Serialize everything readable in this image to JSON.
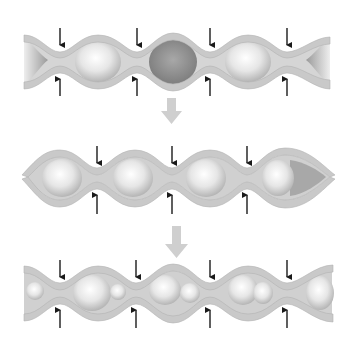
{
  "diagram": {
    "title": "",
    "colors": {
      "wall": "#c9c9c9",
      "wall_edge": "#b2b2b2",
      "lumen": "#8f8f8f",
      "lumen_light": "#d8d8d8",
      "bolus": "#f2f2f2",
      "bolus_shade": "#bdbdbd",
      "constriction_arrow": "#1a1a1a",
      "step_arrow": "#cfcfcf"
    },
    "stages": [
      {
        "id": "stage-1",
        "constriction_x": [
          60,
          137,
          210,
          287
        ],
        "bolus_count": 2,
        "empty_segment": "center"
      },
      {
        "id": "stage-2",
        "constriction_x": [
          97,
          172,
          247
        ],
        "bolus_count": 4
      },
      {
        "id": "stage-3",
        "constriction_x": [
          60,
          136,
          210,
          287
        ],
        "bolus_count": 7
      }
    ],
    "step_arrows": [
      {
        "id": "step-arrow-1",
        "direction": "down"
      },
      {
        "id": "step-arrow-2",
        "direction": "down"
      }
    ],
    "labels": []
  }
}
